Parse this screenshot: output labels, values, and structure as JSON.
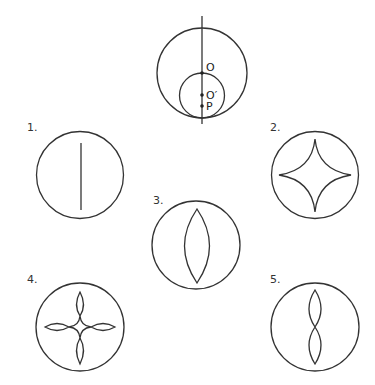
{
  "main_figure": {
    "point_labels": {
      "o": "O",
      "o_prime": "O′",
      "p": "P"
    }
  },
  "options": [
    {
      "label": "1.",
      "shape": "vertical-line-segment"
    },
    {
      "label": "2.",
      "shape": "astroid"
    },
    {
      "label": "3.",
      "shape": "lens"
    },
    {
      "label": "4.",
      "shape": "four-petal-astroid"
    },
    {
      "label": "5.",
      "shape": "figure-eight-vertical"
    }
  ],
  "colors": {
    "stroke": "#333333",
    "background": "#ffffff"
  }
}
